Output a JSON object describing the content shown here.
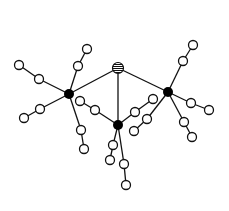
{
  "diagram": {
    "type": "graph",
    "colors": {
      "background": "#ffffff",
      "stroke": "#111111",
      "hub_fill": "#000000",
      "leaf_fill": "#ffffff"
    },
    "nodes": [
      {
        "id": "center",
        "kind": "striped",
        "x": 118,
        "y": 68,
        "r": 5.5
      },
      {
        "id": "hubL",
        "kind": "hub",
        "x": 69,
        "y": 94,
        "r": 5
      },
      {
        "id": "hubR",
        "kind": "hub",
        "x": 168,
        "y": 92,
        "r": 5
      },
      {
        "id": "hubB",
        "kind": "hub",
        "x": 118,
        "y": 125,
        "r": 5
      },
      {
        "id": "L1a",
        "kind": "leaf",
        "x": 78,
        "y": 66,
        "r": 4.5
      },
      {
        "id": "L1b",
        "kind": "leaf",
        "x": 87,
        "y": 49,
        "r": 4.5
      },
      {
        "id": "L2a",
        "kind": "leaf",
        "x": 39,
        "y": 79,
        "r": 4.5
      },
      {
        "id": "L2b",
        "kind": "leaf",
        "x": 19,
        "y": 65,
        "r": 4.5
      },
      {
        "id": "L3a",
        "kind": "leaf",
        "x": 40,
        "y": 109,
        "r": 4.5
      },
      {
        "id": "L3b",
        "kind": "leaf",
        "x": 24,
        "y": 118,
        "r": 4.5
      },
      {
        "id": "L4a",
        "kind": "leaf",
        "x": 81,
        "y": 130,
        "r": 4.5
      },
      {
        "id": "L4b",
        "kind": "leaf",
        "x": 84,
        "y": 149,
        "r": 4.5
      },
      {
        "id": "L5a",
        "kind": "leaf",
        "x": 80,
        "y": 101,
        "r": 4.5
      },
      {
        "id": "L5b",
        "kind": "leaf",
        "x": 95,
        "y": 110,
        "r": 4.5
      },
      {
        "id": "R1a",
        "kind": "leaf",
        "x": 183,
        "y": 61,
        "r": 4.5
      },
      {
        "id": "R1b",
        "kind": "leaf",
        "x": 193,
        "y": 45,
        "r": 4.5
      },
      {
        "id": "R2a",
        "kind": "leaf",
        "x": 191,
        "y": 103,
        "r": 4.5
      },
      {
        "id": "R2b",
        "kind": "leaf",
        "x": 209,
        "y": 110,
        "r": 4.5
      },
      {
        "id": "R3a",
        "kind": "leaf",
        "x": 184,
        "y": 122,
        "r": 4.5
      },
      {
        "id": "R3b",
        "kind": "leaf",
        "x": 192,
        "y": 137,
        "r": 4.5
      },
      {
        "id": "R4a",
        "kind": "leaf",
        "x": 153,
        "y": 99,
        "r": 4.5
      },
      {
        "id": "R4b",
        "kind": "leaf",
        "x": 135,
        "y": 112,
        "r": 4.5
      },
      {
        "id": "R5a",
        "kind": "leaf",
        "x": 147,
        "y": 119,
        "r": 4.5
      },
      {
        "id": "R5b",
        "kind": "leaf",
        "x": 134,
        "y": 131,
        "r": 4.5
      },
      {
        "id": "B1a",
        "kind": "leaf",
        "x": 113,
        "y": 145,
        "r": 4.5
      },
      {
        "id": "B1b",
        "kind": "leaf",
        "x": 110,
        "y": 160,
        "r": 4.5
      },
      {
        "id": "B2a",
        "kind": "leaf",
        "x": 124,
        "y": 164,
        "r": 4.5
      },
      {
        "id": "B2b",
        "kind": "leaf",
        "x": 126,
        "y": 185,
        "r": 4.5
      }
    ],
    "edges": [
      [
        "center",
        "hubL"
      ],
      [
        "center",
        "hubR"
      ],
      [
        "center",
        "hubB"
      ],
      [
        "hubL",
        "L1a"
      ],
      [
        "L1a",
        "L1b"
      ],
      [
        "hubL",
        "L2a"
      ],
      [
        "L2a",
        "L2b"
      ],
      [
        "hubL",
        "L3a"
      ],
      [
        "L3a",
        "L3b"
      ],
      [
        "hubL",
        "L4a"
      ],
      [
        "L4a",
        "L4b"
      ],
      [
        "hubB",
        "L5b"
      ],
      [
        "L5b",
        "L5a"
      ],
      [
        "hubR",
        "R1a"
      ],
      [
        "R1a",
        "R1b"
      ],
      [
        "hubR",
        "R2a"
      ],
      [
        "R2a",
        "R2b"
      ],
      [
        "hubR",
        "R3a"
      ],
      [
        "R3a",
        "R3b"
      ],
      [
        "hubB",
        "R4b"
      ],
      [
        "R4b",
        "R4a"
      ],
      [
        "hubR",
        "R5a"
      ],
      [
        "R5a",
        "R5b"
      ],
      [
        "hubB",
        "B1a"
      ],
      [
        "B1a",
        "B1b"
      ],
      [
        "hubB",
        "B2a"
      ],
      [
        "B2a",
        "B2b"
      ]
    ]
  }
}
